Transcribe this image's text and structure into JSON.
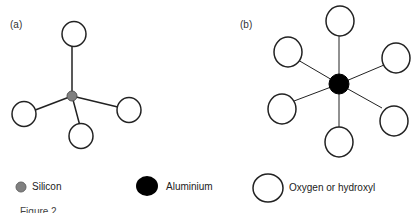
{
  "panels": {
    "a": {
      "label": "(a)",
      "description": "Silicon tetrahedron: silicon center bonded to 4 oxygen/hydroxyl"
    },
    "b": {
      "label": "(b)",
      "description": "Aluminium octahedron: aluminium center bonded to 6 oxygen/hydroxyl"
    }
  },
  "legend": [
    {
      "symbol": "small-grey-circle",
      "label": "Silicon",
      "color": "#808080"
    },
    {
      "symbol": "black-circle",
      "label": "Aluminium",
      "color": "#000000"
    },
    {
      "symbol": "open-circle",
      "label": "Oxygen or hydroxyl",
      "color": "#ffffff"
    }
  ],
  "caption_fragment": "Figure 2"
}
